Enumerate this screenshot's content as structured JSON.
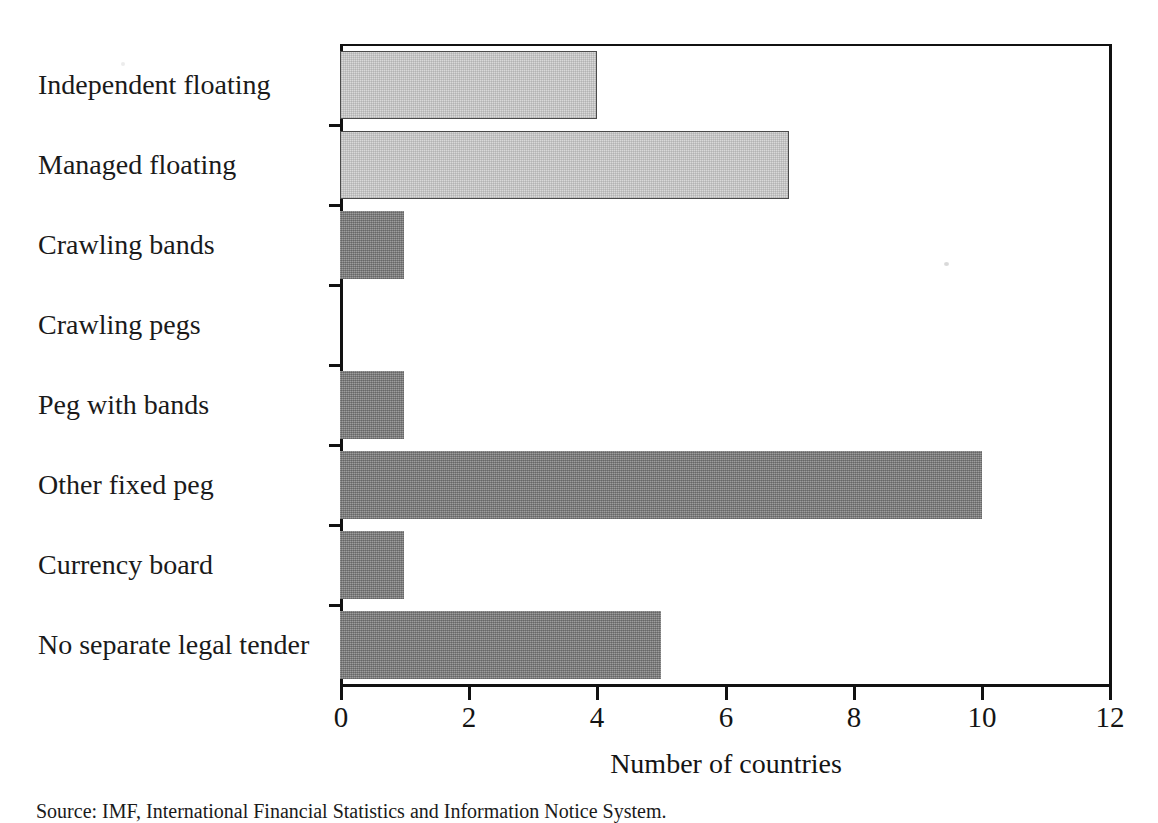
{
  "chart_data": {
    "type": "bar",
    "orientation": "horizontal",
    "title": "",
    "xlabel": "Number of countries",
    "ylabel": "",
    "xlim": [
      0,
      12
    ],
    "xticks": [
      0,
      2,
      4,
      6,
      8,
      10,
      12
    ],
    "xtick_labels": [
      "0",
      "2",
      "4",
      "6",
      "8",
      "10",
      "12"
    ],
    "grid": false,
    "legend": false,
    "categories": [
      "Independent floating",
      "Managed floating",
      "Crawling bands",
      "Crawling pegs",
      "Peg with bands",
      "Other fixed peg",
      "Currency board",
      "No separate legal tender"
    ],
    "values": [
      4,
      7,
      1,
      0,
      1,
      10,
      1,
      5
    ],
    "bar_styles": [
      "light",
      "light",
      "dark",
      "dark",
      "dark",
      "dark",
      "dark",
      "dark"
    ],
    "colors": {
      "light_fill": "#d9d9d9",
      "light_border": "#4a4a4a",
      "dark_fill": "#828282",
      "axis": "#111111",
      "text": "#141414",
      "background": "#ffffff"
    }
  },
  "figure": {
    "source_note": "Source: IMF, International Financial Statistics and Information Notice System."
  }
}
